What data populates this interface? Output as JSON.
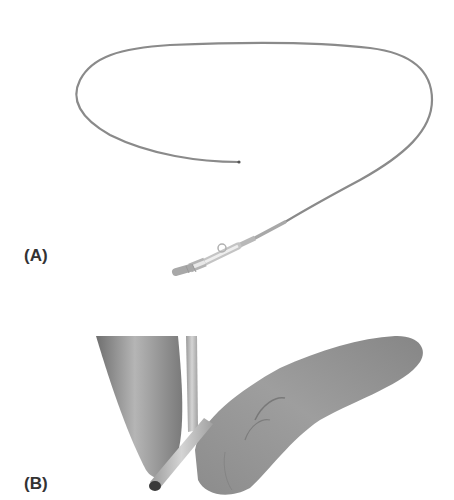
{
  "figure": {
    "panels": [
      {
        "label": "(A)",
        "description": "Long flexible catheter forming a loop, with a hub/connector assembly at the proximal end"
      },
      {
        "label": "(B)",
        "description": "Fingers holding a thin tube/catheter between them"
      }
    ],
    "colors": {
      "background": "#ffffff",
      "label": "#333333",
      "wire": "#8a8a8a",
      "skin": "#9a9a9a"
    }
  }
}
